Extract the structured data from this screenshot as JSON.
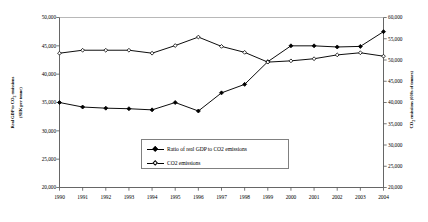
{
  "chart_data": {
    "type": "line",
    "title": "",
    "subtitle": "",
    "xlabel": "",
    "ylabel": "Real GDP to CO2 emissions (SEK per tonne)",
    "ylabel_left_lines": [
      "Real GDP to CO",
      "2",
      " emissions",
      "(SEK per tonne)"
    ],
    "ylabel_right_lines": [
      "CO",
      "2",
      " emissions (000s of tonnes)"
    ],
    "ylabel_right": "CO2 emissions (000s of tonnes)",
    "categories": [
      "1990",
      "1991",
      "1992",
      "1993",
      "1994",
      "1995",
      "1996",
      "1997",
      "1998",
      "1999",
      "2000",
      "2001",
      "2002",
      "2003",
      "2004"
    ],
    "x": [
      1990,
      1991,
      1992,
      1993,
      1994,
      1995,
      1996,
      1997,
      1998,
      1999,
      2000,
      2001,
      2002,
      2003,
      2004
    ],
    "grid": false,
    "legend_position": "inside-bottom-center",
    "axes": {
      "left": {
        "label": "Real GDP to CO2 emissions (SEK per tonne)",
        "ticks": [
          "50,000",
          "45,000",
          "40,000",
          "35,000",
          "30,000",
          "25,000",
          "20,000"
        ],
        "tick_values": [
          50000,
          45000,
          40000,
          35000,
          30000,
          25000,
          20000
        ],
        "ylim": [
          20000,
          50000
        ]
      },
      "right": {
        "label": "CO2 emissions (000s of tonnes)",
        "ticks": [
          "60,000",
          "55,000",
          "50,000",
          "45,000",
          "40,000",
          "35,000",
          "30,000",
          "25,000",
          "20,000"
        ],
        "tick_values": [
          60000,
          55000,
          50000,
          45000,
          40000,
          35000,
          30000,
          25000,
          20000
        ],
        "ylim": [
          20000,
          60000
        ]
      }
    },
    "series": [
      {
        "name": "Ratio of real GDP to CO2 emissions",
        "axis": "left",
        "marker": "filled-diamond",
        "color": "#000000",
        "values": [
          35000,
          34200,
          34000,
          33900,
          33700,
          35000,
          33500,
          36700,
          38200,
          42200,
          45000,
          45000,
          44800,
          44900,
          47500
        ]
      },
      {
        "name": "CO2 emissions",
        "axis": "right",
        "marker": "open-diamond",
        "color": "#000000",
        "values": [
          51600,
          52300,
          52300,
          52300,
          51600,
          53400,
          55400,
          53200,
          51800,
          49500,
          49800,
          50300,
          51200,
          51700,
          50900
        ]
      }
    ]
  },
  "legend": {
    "items": [
      {
        "label": "Ratio of real GDP to CO2 emissions",
        "marker": "filled-diamond"
      },
      {
        "label": "CO2 emissions",
        "marker": "open-diamond"
      }
    ]
  }
}
